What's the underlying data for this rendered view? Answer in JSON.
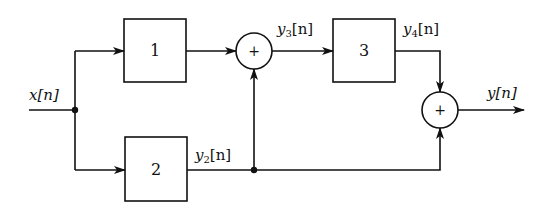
{
  "diagram": {
    "type": "block-diagram",
    "signals": {
      "input": "x[n]",
      "y2": {
        "base": "y",
        "sub": "2",
        "arg": "[n]"
      },
      "y3": {
        "base": "y",
        "sub": "3",
        "arg": "[n]"
      },
      "y4": {
        "base": "y",
        "sub": "4",
        "arg": "[n]"
      },
      "output": "y[n]"
    },
    "blocks": [
      {
        "id": "block-1",
        "label": "1"
      },
      {
        "id": "block-2",
        "label": "2"
      },
      {
        "id": "block-3",
        "label": "3"
      }
    ],
    "adders": [
      {
        "id": "adder-1",
        "symbol": "+"
      },
      {
        "id": "adder-2",
        "symbol": "+"
      }
    ],
    "connections": [
      [
        "x[n]",
        "block-1"
      ],
      [
        "x[n]",
        "block-2"
      ],
      [
        "block-1",
        "adder-1"
      ],
      [
        "block-2",
        "adder-1"
      ],
      [
        "block-2",
        "adder-2"
      ],
      [
        "adder-1",
        "block-3"
      ],
      [
        "block-3",
        "adder-2"
      ],
      [
        "adder-2",
        "y[n]"
      ]
    ],
    "colors": {
      "stroke": "#111111",
      "background": "#ffffff"
    }
  }
}
